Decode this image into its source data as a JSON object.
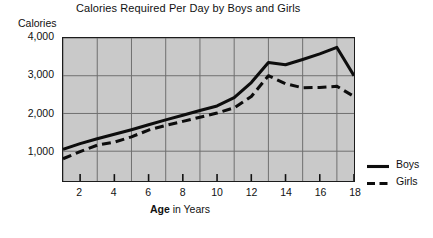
{
  "chart_data": {
    "type": "line",
    "title": "Calories Required Per Day by Boys and Girls",
    "xlabel_bold": "Age",
    "xlabel_rest": " in Years",
    "xlabel": "Age in Years",
    "ylabel": "Calories",
    "x": [
      1,
      2,
      3,
      4,
      5,
      6,
      7,
      8,
      9,
      10,
      11,
      12,
      13,
      14,
      15,
      16,
      17,
      18
    ],
    "xlim": [
      1,
      18
    ],
    "ylim": [
      210,
      4000
    ],
    "grid": true,
    "legend_position": "right",
    "xticks": [
      "2",
      "4",
      "6",
      "8",
      "10",
      "12",
      "14",
      "16",
      "18"
    ],
    "xtick_values": [
      2,
      4,
      6,
      8,
      10,
      12,
      14,
      16,
      18
    ],
    "yticks": [
      "1,000",
      "2,000",
      "3,000",
      "4,000"
    ],
    "ytick_values": [
      1000,
      2000,
      3000,
      4000
    ],
    "series": [
      {
        "name": "Boys",
        "style": "solid",
        "color": "#0d0d0d",
        "values": [
          1050,
          1200,
          1330,
          1450,
          1570,
          1700,
          1830,
          1950,
          2080,
          2200,
          2420,
          2820,
          3350,
          3290,
          3430,
          3580,
          3750,
          3000
        ]
      },
      {
        "name": "Girls",
        "style": "dashed",
        "color": "#0d0d0d",
        "values": [
          800,
          990,
          1160,
          1240,
          1380,
          1560,
          1680,
          1790,
          1900,
          2010,
          2150,
          2450,
          3000,
          2790,
          2680,
          2690,
          2720,
          2450
        ]
      }
    ]
  },
  "legend": {
    "items": [
      {
        "label": "Boys",
        "style": "solid"
      },
      {
        "label": "Girls",
        "style": "dashed"
      }
    ]
  }
}
